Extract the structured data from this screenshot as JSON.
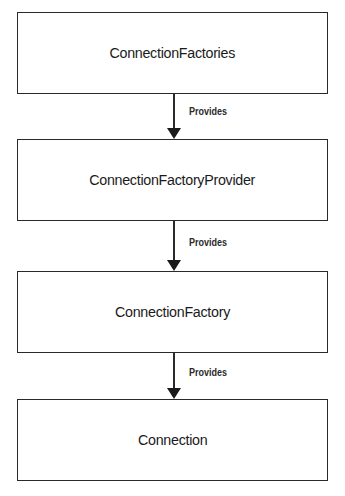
{
  "diagram": {
    "nodes": [
      {
        "id": "n1",
        "label": "ConnectionFactories"
      },
      {
        "id": "n2",
        "label": "ConnectionFactoryProvider"
      },
      {
        "id": "n3",
        "label": "ConnectionFactory"
      },
      {
        "id": "n4",
        "label": "Connection"
      }
    ],
    "edges": [
      {
        "from": "n1",
        "to": "n2",
        "label": "Provides"
      },
      {
        "from": "n2",
        "to": "n3",
        "label": "Provides"
      },
      {
        "from": "n3",
        "to": "n4",
        "label": "Provides"
      }
    ]
  }
}
